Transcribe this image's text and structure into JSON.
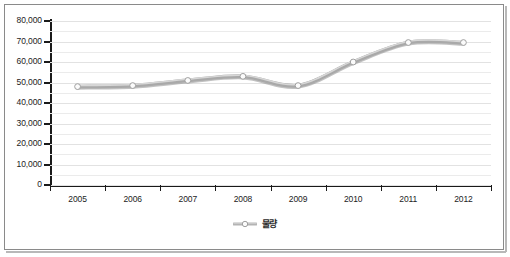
{
  "chart_data": {
    "type": "line",
    "title": "",
    "xlabel": "",
    "ylabel": "",
    "categories": [
      "2005",
      "2006",
      "2007",
      "2008",
      "2009",
      "2010",
      "2011",
      "2012"
    ],
    "series": [
      {
        "name": "물량",
        "values": [
          48000,
          48500,
          51000,
          53000,
          48500,
          60000,
          69500,
          69500
        ]
      }
    ],
    "ylim": [
      0,
      80000
    ],
    "y_ticks": [
      0,
      10000,
      20000,
      30000,
      40000,
      50000,
      60000,
      70000,
      80000
    ],
    "y_tick_labels": [
      "0",
      "10,000",
      "20,000",
      "30,000",
      "40,000",
      "50,000",
      "60,000",
      "70,000",
      "80,000"
    ],
    "grid": true,
    "minor_grid": true,
    "legend_position": "bottom",
    "marker": "circle",
    "colors": {
      "line": "#a9a9a9",
      "line_highlight": "#d9d9d9",
      "line_shadow": "#8f8f8f",
      "marker_fill": "#fbfbfb",
      "marker_stroke": "#a0a0a0",
      "axis": "#1a1a1a",
      "gridline": "#ebebeb",
      "frame_border": "#8a8a8a",
      "text": "#1c1c1c",
      "background": "#ffffff"
    }
  },
  "legend": {
    "items": [
      {
        "label": "물량"
      }
    ]
  }
}
